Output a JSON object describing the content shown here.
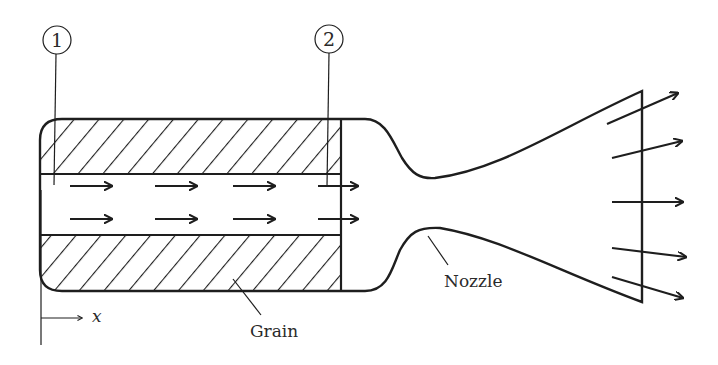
{
  "diagram": {
    "type": "rocket-motor-cross-section",
    "station_labels": [
      {
        "id": "station-1",
        "text": "1"
      },
      {
        "id": "station-2",
        "text": "2"
      }
    ],
    "component_labels": {
      "grain": "Grain",
      "nozzle": "Nozzle"
    },
    "axis": {
      "label": "x"
    },
    "internal_flow_arrows": {
      "rows": 2,
      "per_row": 4
    },
    "exit_flow_arrows": 5,
    "colors": {
      "line": "#1e1e1e",
      "text": "#2a2a2a",
      "background": "#ffffff"
    }
  }
}
